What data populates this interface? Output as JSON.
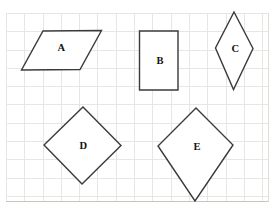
{
  "canvas": {
    "width": 274,
    "height": 208,
    "background": "#ffffff"
  },
  "grid": {
    "x": 6,
    "y": 13,
    "width": 263,
    "height": 189,
    "cell_size": 18.3,
    "line_color": "#e9e6e1",
    "edge_bottom_color": "#c9c6c0",
    "edge_right_color": "#e0ddd7"
  },
  "style": {
    "stroke_color": "#3a3a3a",
    "stroke_width": 1.4,
    "fill_color": "#ffffff",
    "label_color": "#111111",
    "label_font_size": 10.5
  },
  "shapes": [
    {
      "id": "A",
      "name": "parallelogram",
      "label": "A",
      "points": [
        [
          43,
          31
        ],
        [
          101.5,
          30.5
        ],
        [
          80,
          69.5
        ],
        [
          21.5,
          70
        ]
      ],
      "label_pos": [
        61.5,
        47.5
      ]
    },
    {
      "id": "B",
      "name": "rectangle",
      "label": "B",
      "points": [
        [
          139.5,
          31
        ],
        [
          178,
          31
        ],
        [
          178,
          90
        ],
        [
          139.5,
          90
        ]
      ],
      "label_pos": [
        160,
        60.5
      ]
    },
    {
      "id": "C",
      "name": "rhombus",
      "label": "C",
      "points": [
        [
          234,
          12
        ],
        [
          253,
          48.5
        ],
        [
          233.5,
          89.5
        ],
        [
          215.5,
          48
        ]
      ],
      "label_pos": [
        235.5,
        48.5
      ]
    },
    {
      "id": "D",
      "name": "rotated-square",
      "label": "D",
      "points": [
        [
          83,
          107
        ],
        [
          121,
          145.5
        ],
        [
          82,
          184
        ],
        [
          44,
          145
        ]
      ],
      "label_pos": [
        83.5,
        145.5
      ]
    },
    {
      "id": "E",
      "name": "kite",
      "label": "E",
      "points": [
        [
          196,
          108
        ],
        [
          233,
          145
        ],
        [
          195,
          201
        ],
        [
          158,
          146
        ]
      ],
      "label_pos": [
        197,
        146.5
      ]
    }
  ]
}
